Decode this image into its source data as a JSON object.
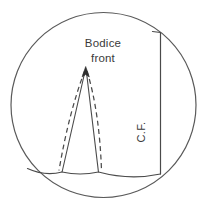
{
  "figure": {
    "canvas": {
      "width": 210,
      "height": 212,
      "background": "#ffffff"
    },
    "ink_color": "#4a4a4a",
    "text_color": "#3a3a3a",
    "labels": {
      "bodice": "Bodice",
      "front": "front",
      "center_front": "C.F."
    },
    "label_positions": {
      "bodice": {
        "x": 103,
        "y": 43
      },
      "front": {
        "x": 103,
        "y": 58
      },
      "center_front": {
        "x": 141,
        "y": 132,
        "rotation": -90
      }
    },
    "circle": {
      "cx": 103.5,
      "cy": 105,
      "r": 92.5,
      "stroke": "#5a5a5a",
      "stroke_width": 1.2,
      "fill": "none"
    },
    "center_front_line": {
      "x": 160,
      "y_top": 32,
      "y_bottom": 174,
      "stroke_width": 1.2,
      "top_tick_x_left": 152
    },
    "hem_line": {
      "start": {
        "x": 28,
        "y": 169
      },
      "end": {
        "x": 160,
        "y": 174
      },
      "curve_note": "slightly concave-upward scalloped hem between dart legs"
    },
    "dart": {
      "apex": {
        "x": 85.5,
        "y": 69
      },
      "left_foot": {
        "x": 62,
        "y": 172
      },
      "right_foot": {
        "x": 98.5,
        "y": 172
      },
      "solid_stroke_width": 1.1,
      "dashed_stroke_width": 1.2,
      "dash_pattern": "5,3.5",
      "dash_note": "curved dashed guide lines lie just outside each solid dart leg"
    }
  }
}
